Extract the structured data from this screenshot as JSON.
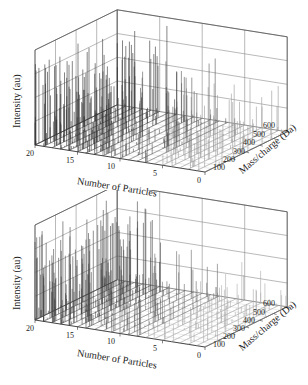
{
  "figure": {
    "panels": 2
  },
  "chart_data": [
    {
      "type": "3d-waterfall",
      "panel": "top",
      "title": "",
      "xlabel": "Number of Particles",
      "ylabel": "Mass/charge (Da)",
      "zlabel": "Intensity (au)",
      "x_ticks": [
        "20",
        "15",
        "10",
        "5",
        "0"
      ],
      "x_range": [
        0,
        20
      ],
      "y_ticks": [
        "100",
        "200",
        "300",
        "400",
        "500",
        "600"
      ],
      "y_range": [
        0,
        600
      ],
      "z_ticks": [],
      "grid": true,
      "description": "Stacked mass spectra of individual particles; dense tall peaks for particles 13-20, sparser lower peaks for particles 0-10",
      "peak_density_by_particle_range": [
        {
          "range": "13-20",
          "relative_intensity": "high",
          "color": "#333333"
        },
        {
          "range": "7-12",
          "relative_intensity": "medium",
          "color": "#555555"
        },
        {
          "range": "0-6",
          "relative_intensity": "low",
          "color": "#999999"
        }
      ]
    },
    {
      "type": "3d-waterfall",
      "panel": "bottom",
      "title": "",
      "xlabel": "Number of Particles",
      "ylabel": "Mass/charge (Da)",
      "zlabel": "Intensity (au)",
      "x_ticks": [
        "20",
        "15",
        "10",
        "5",
        "0"
      ],
      "x_range": [
        0,
        20
      ],
      "y_ticks": [
        "100",
        "200",
        "300",
        "400",
        "500",
        "600"
      ],
      "y_range": [
        0,
        600
      ],
      "z_ticks": [],
      "grid": true,
      "description": "Stacked mass spectra of individual particles; dense tall peaks for particles 14-20, moderate for 8-12, sparse low peaks for 0-7",
      "peak_density_by_particle_range": [
        {
          "range": "14-20",
          "relative_intensity": "high",
          "color": "#444444"
        },
        {
          "range": "8-12",
          "relative_intensity": "medium",
          "color": "#666666"
        },
        {
          "range": "0-7",
          "relative_intensity": "low",
          "color": "#aaaaaa"
        }
      ]
    }
  ],
  "labels": {
    "x_title": "Number of Particles",
    "y_title": "Mass/charge (Da)",
    "z_title": "Intensity (au)",
    "x_ticks": [
      "20",
      "15",
      "10",
      "5",
      "0"
    ],
    "y_ticks": [
      "100",
      "200",
      "300",
      "400",
      "500",
      "600"
    ]
  }
}
